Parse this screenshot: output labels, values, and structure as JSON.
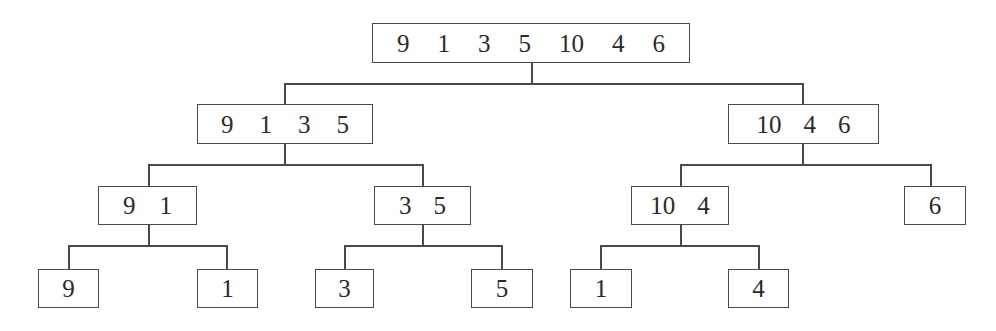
{
  "diagram": {
    "type": "merge-sort split tree",
    "nodes": [
      {
        "id": "root",
        "level": 0,
        "values": [
          "9",
          "1",
          "3",
          "5",
          "10",
          "4",
          "6"
        ],
        "box": [
          372,
          23,
          318,
          40
        ],
        "gap": 28
      },
      {
        "id": "l",
        "level": 1,
        "values": [
          "9",
          "1",
          "3",
          "5"
        ],
        "box": [
          197,
          104,
          176,
          40
        ],
        "gap": 26
      },
      {
        "id": "r",
        "level": 1,
        "values": [
          "10",
          "4",
          "6"
        ],
        "box": [
          728,
          104,
          151,
          40
        ],
        "gap": 22
      },
      {
        "id": "ll",
        "level": 2,
        "values": [
          "9",
          "1"
        ],
        "box": [
          98,
          186,
          99,
          39
        ],
        "gap": 24
      },
      {
        "id": "lr",
        "level": 2,
        "values": [
          "3",
          "5"
        ],
        "box": [
          374,
          186,
          97,
          39
        ],
        "gap": 22
      },
      {
        "id": "rl",
        "level": 2,
        "values": [
          "10",
          "4"
        ],
        "box": [
          631,
          186,
          98,
          39
        ],
        "gap": 22
      },
      {
        "id": "rr",
        "level": 2,
        "values": [
          "6"
        ],
        "box": [
          904,
          186,
          62,
          39
        ],
        "gap": 0
      },
      {
        "id": "lll",
        "level": 3,
        "values": [
          "9"
        ],
        "box": [
          38,
          269,
          61,
          39
        ],
        "gap": 0
      },
      {
        "id": "llr",
        "level": 3,
        "values": [
          "1"
        ],
        "box": [
          197,
          269,
          61,
          39
        ],
        "gap": 0
      },
      {
        "id": "lrl",
        "level": 3,
        "values": [
          "3"
        ],
        "box": [
          315,
          269,
          59,
          39
        ],
        "gap": 0
      },
      {
        "id": "lrr",
        "level": 3,
        "values": [
          "5"
        ],
        "box": [
          471,
          269,
          62,
          39
        ],
        "gap": 0
      },
      {
        "id": "rll",
        "level": 3,
        "values": [
          "1"
        ],
        "box": [
          570,
          269,
          62,
          39
        ],
        "gap": 0
      },
      {
        "id": "rlr",
        "level": 3,
        "values": [
          "4"
        ],
        "box": [
          728,
          269,
          61,
          39
        ],
        "gap": 0
      }
    ],
    "edges": [
      {
        "parent": "root",
        "children": [
          "l",
          "r"
        ],
        "parent_x": 532,
        "parent_bottom": 63,
        "bar_y": 83,
        "child_xs": [
          285,
          803
        ],
        "child_top": 104
      },
      {
        "parent": "l",
        "children": [
          "ll",
          "lr"
        ],
        "parent_x": 285,
        "parent_bottom": 144,
        "bar_y": 164,
        "child_xs": [
          149,
          423
        ],
        "child_top": 186
      },
      {
        "parent": "r",
        "children": [
          "rl",
          "rr"
        ],
        "parent_x": 803,
        "parent_bottom": 144,
        "bar_y": 164,
        "child_xs": [
          681,
          931
        ],
        "child_top": 186
      },
      {
        "parent": "ll",
        "children": [
          "lll",
          "llr"
        ],
        "parent_x": 149,
        "parent_bottom": 225,
        "bar_y": 245,
        "child_xs": [
          69,
          227
        ],
        "child_top": 269
      },
      {
        "parent": "lr",
        "children": [
          "lrl",
          "lrr"
        ],
        "parent_x": 423,
        "parent_bottom": 225,
        "bar_y": 245,
        "child_xs": [
          345,
          502
        ],
        "child_top": 269
      },
      {
        "parent": "rl",
        "children": [
          "rll",
          "rlr"
        ],
        "parent_x": 681,
        "parent_bottom": 225,
        "bar_y": 245,
        "child_xs": [
          601,
          759
        ],
        "child_top": 269
      }
    ]
  },
  "colors": {
    "line": "#4a4a4a",
    "text": "#2a2a2a",
    "background": "#ffffff"
  }
}
